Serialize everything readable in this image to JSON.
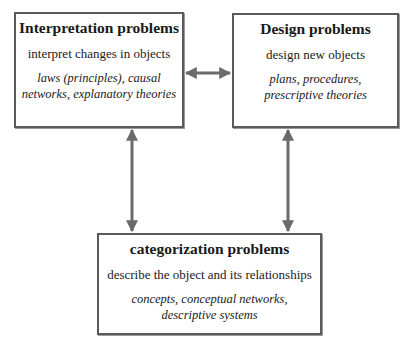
{
  "diagram": {
    "nodes": [
      {
        "id": "interpretation",
        "title": "Interpretation problems",
        "description": "interpret changes in objects",
        "examples_line1": "laws (principles), causal",
        "examples_line2": "networks, explanatory theories"
      },
      {
        "id": "design",
        "title": "Design problems",
        "description": "design new objects",
        "examples_line1": "plans, procedures,",
        "examples_line2": "prescriptive theories"
      },
      {
        "id": "categorization",
        "title": "categorization problems",
        "description": "describe the object and its relationships",
        "examples_line1": "concepts, conceptual networks,",
        "examples_line2": "descriptive systems"
      }
    ],
    "edges": [
      {
        "from": "interpretation",
        "to": "design",
        "type": "bidirectional"
      },
      {
        "from": "interpretation",
        "to": "categorization",
        "type": "bidirectional"
      },
      {
        "from": "design",
        "to": "categorization",
        "type": "bidirectional"
      }
    ],
    "colors": {
      "border": "#5a5a5a",
      "arrow": "#6b6b6b",
      "background": "#ffffff"
    }
  }
}
